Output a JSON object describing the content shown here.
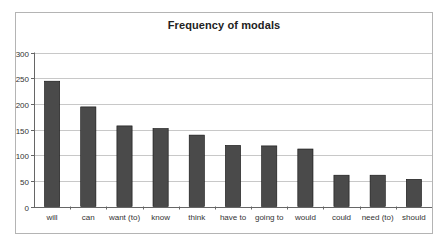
{
  "chart_data": {
    "type": "bar",
    "title": "Frequency of modals",
    "xlabel": "",
    "ylabel": "",
    "categories": [
      "will",
      "can",
      "want (to)",
      "know",
      "think",
      "have to",
      "going to",
      "would",
      "could",
      "need (to)",
      "should"
    ],
    "values": [
      244,
      194,
      157,
      152,
      139,
      119,
      118,
      112,
      61,
      61,
      53
    ],
    "ylim": [
      0,
      300
    ],
    "yticks": [
      0,
      50,
      100,
      150,
      200,
      250,
      300
    ],
    "grid": true,
    "legend": null,
    "bar_color": "#4a4a4a",
    "bar_edge_color": "#111111",
    "grid_color": "#c8c8c8"
  }
}
